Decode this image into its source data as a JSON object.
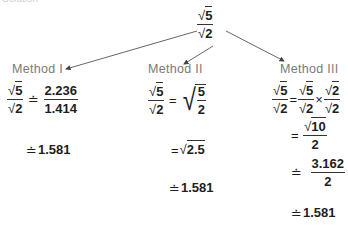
{
  "header": {
    "cropped_title": "Solution"
  },
  "top_expression": {
    "numerator": "5",
    "denominator": "2"
  },
  "methods": [
    {
      "label": "Method I",
      "steps": [
        {
          "lhs_num": "5",
          "lhs_den": "2",
          "relation": "≐",
          "rhs_num": "2.236",
          "rhs_den": "1.414"
        },
        {
          "relation": "≐",
          "value": "1.581"
        }
      ]
    },
    {
      "label": "Method II",
      "steps": [
        {
          "lhs_num": "5",
          "lhs_den": "2",
          "relation": "=",
          "rhs_sqrt_num": "5",
          "rhs_sqrt_den": "2"
        },
        {
          "relation": "=",
          "sqrt_value": "2.5"
        },
        {
          "relation": "≐",
          "value": "1.581"
        }
      ]
    },
    {
      "label": "Method III",
      "steps": [
        {
          "lhs_num": "5",
          "lhs_den": "2",
          "relation": "=",
          "a_num": "5",
          "a_den": "2",
          "times": "×",
          "b_num": "2",
          "b_den": "2"
        },
        {
          "relation": "=",
          "sqrt_num": "10",
          "den": "2"
        },
        {
          "relation": "≐",
          "num": "3.162",
          "den": "2"
        },
        {
          "relation": "≐",
          "value": "1.581"
        }
      ]
    }
  ]
}
